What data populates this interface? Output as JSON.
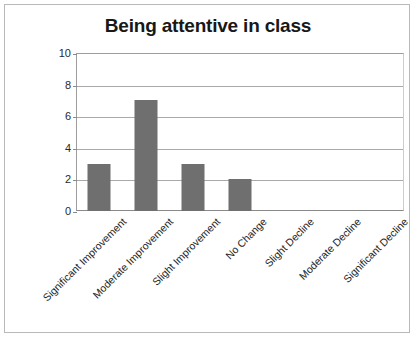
{
  "chart_data": {
    "type": "bar",
    "title": "Being attentive in class",
    "xlabel": "",
    "ylabel": "",
    "categories": [
      "Significant Improvement",
      "Moderate Improvement",
      "Slight Improvement",
      "No Change",
      "Slight Decline",
      "Moderate Decline",
      "Significant Decline"
    ],
    "values": [
      3,
      7,
      3,
      2,
      0,
      0,
      0
    ],
    "ylim": [
      0,
      10
    ],
    "yticks": [
      0,
      2,
      4,
      6,
      8,
      10
    ],
    "ytick_labels": [
      "0",
      "2",
      "4",
      "6",
      "8",
      "10"
    ],
    "grid": true,
    "legend": false,
    "legend_position": "none",
    "bar_color": "#706f6f",
    "grid_color": "#a9a9a9",
    "axis_color": "#8a8a8a",
    "background_color": "#ffffff",
    "title_color": "#181818",
    "label_rotation": 45
  }
}
